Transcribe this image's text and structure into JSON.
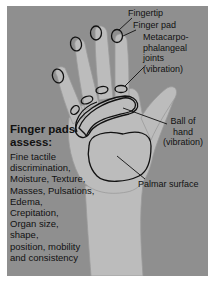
{
  "figure": {
    "labels": {
      "fingertip": "Fingertip",
      "finger_pad": "Finger pad",
      "mcp_joints": [
        "Metacarpo-",
        "phalangeal",
        "joints",
        "(vibration)"
      ],
      "ball_of_hand": [
        "Ball of",
        "hand",
        "(vibration)"
      ],
      "palmar_surface": "Palmar surface"
    },
    "side_panel": {
      "title": [
        "Finger pads",
        "assess:"
      ],
      "lines": [
        "Fine tactile",
        "discrimination,",
        "Moisture, Texture,",
        "Masses, Pulsations,",
        "Edema,",
        "Crepitation,",
        "Organ size,",
        "shape,",
        "position, mobility",
        "and consistency"
      ]
    },
    "colors": {
      "background": "#8f8f8f",
      "skin": "#b9b9b9",
      "outline": "#111111"
    }
  }
}
